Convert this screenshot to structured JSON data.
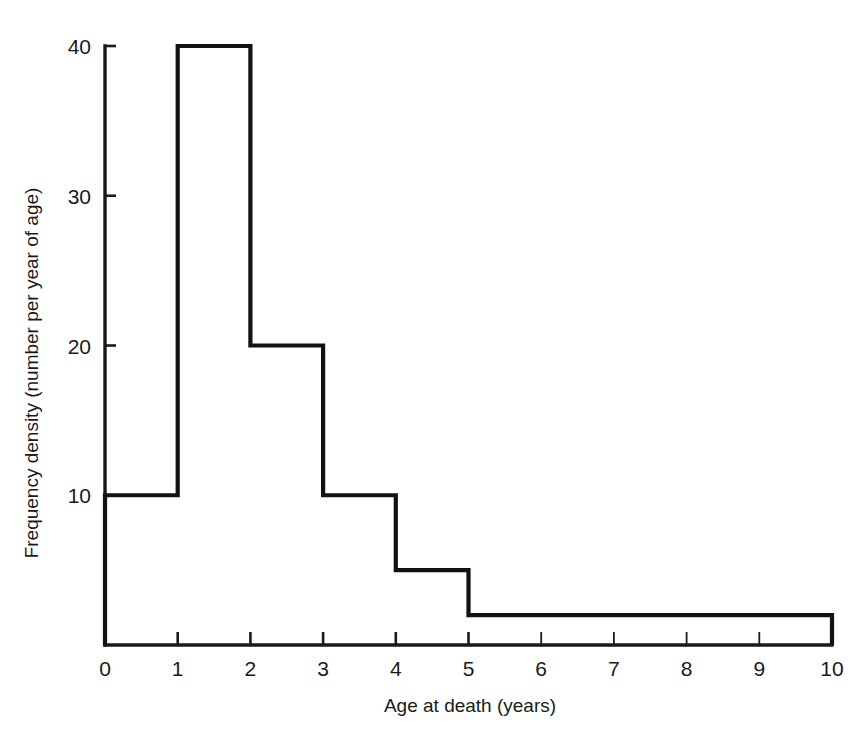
{
  "chart_data": {
    "type": "bar",
    "subtype": "histogram",
    "title": "",
    "xlabel": "Age at death (years)",
    "ylabel": "Frequency density (number per year of age)",
    "xlim": [
      0,
      10
    ],
    "ylim": [
      0,
      40
    ],
    "grid": false,
    "legend": null,
    "xticks": [
      0,
      1,
      2,
      3,
      4,
      5,
      6,
      7,
      8,
      9,
      10
    ],
    "xtick_labels": [
      "0",
      "1",
      "2",
      "3",
      "4",
      "5",
      "6",
      "7",
      "8",
      "9",
      "10"
    ],
    "yticks": [
      10,
      20,
      30,
      40
    ],
    "ytick_labels": [
      "10",
      "20",
      "30",
      "40"
    ],
    "bins": [
      {
        "label": "0-1",
        "start": 0,
        "end": 1,
        "value": 10
      },
      {
        "label": "1-2",
        "start": 1,
        "end": 2,
        "value": 40
      },
      {
        "label": "2-3",
        "start": 2,
        "end": 3,
        "value": 20
      },
      {
        "label": "3-4",
        "start": 3,
        "end": 4,
        "value": 10
      },
      {
        "label": "4-5",
        "start": 4,
        "end": 5,
        "value": 5
      },
      {
        "label": "5-10",
        "start": 5,
        "end": 10,
        "value": 2
      }
    ],
    "categories": [
      "0-1",
      "1-2",
      "2-3",
      "3-4",
      "4-5",
      "5-10"
    ],
    "values": [
      10,
      40,
      20,
      10,
      5,
      2
    ],
    "colors": {
      "background": "#ffffff",
      "outline": "#121212",
      "axis": "#1a1a1a",
      "text": "#1a1a1a"
    }
  }
}
